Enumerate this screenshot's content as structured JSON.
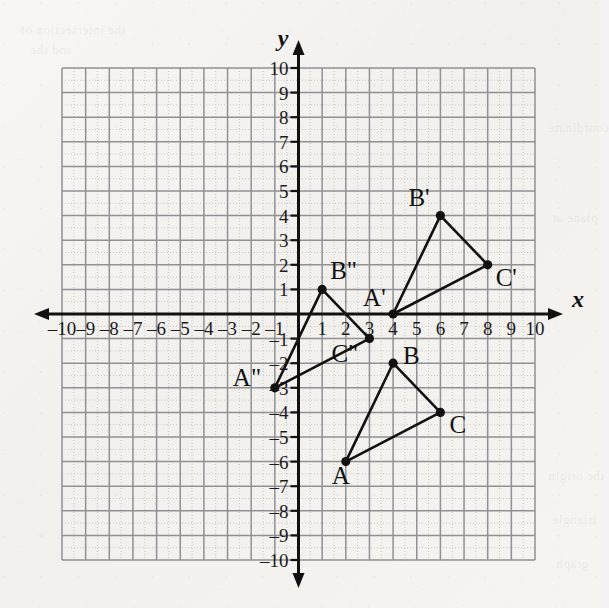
{
  "figure": {
    "axis_labels": {
      "x": "x",
      "y": "y"
    },
    "x_ticks": [
      "–10",
      "–9",
      "–8",
      "–7",
      "–6",
      "–5",
      "–4",
      "–3",
      "–2",
      "–1",
      "1",
      "2",
      "3",
      "4",
      "5",
      "6",
      "7",
      "8",
      "9",
      "10"
    ],
    "y_ticks": [
      "10",
      "9",
      "8",
      "7",
      "6",
      "5",
      "4",
      "3",
      "2",
      "1",
      "–1",
      "–2",
      "–3",
      "–4",
      "–5",
      "–6",
      "–7",
      "–8",
      "–9",
      "–10"
    ],
    "colors": {
      "ink": "#111111",
      "grid_major": "#8f9194",
      "grid_minor": "#c9cacc",
      "paper": "#f4f3f1"
    }
  },
  "chart_data": {
    "type": "scatter",
    "title": "",
    "xlabel": "x",
    "ylabel": "y",
    "xlim": [
      -10,
      10
    ],
    "ylim": [
      -10,
      10
    ],
    "grid": true,
    "legend": "none",
    "series": [
      {
        "name": "Triangle ABC",
        "closed": true,
        "points": [
          {
            "label": "A",
            "x": 2,
            "y": -6,
            "label_dx": -14,
            "label_dy": 22
          },
          {
            "label": "B",
            "x": 4,
            "y": -2,
            "label_dx": 10,
            "label_dy": 1
          },
          {
            "label": "C",
            "x": 6,
            "y": -4,
            "label_dx": 9,
            "label_dy": 21
          }
        ]
      },
      {
        "name": "Triangle A'B'C'",
        "closed": true,
        "points": [
          {
            "label": "A'",
            "x": 4,
            "y": 0,
            "label_dx": -30,
            "label_dy": -8
          },
          {
            "label": "B'",
            "x": 6,
            "y": 4,
            "label_dx": -32,
            "label_dy": -10
          },
          {
            "label": "C'",
            "x": 8,
            "y": 2,
            "label_dx": 8,
            "label_dy": 21
          }
        ]
      },
      {
        "name": "Triangle A\"B\"C\"",
        "closed": true,
        "points": [
          {
            "label": "A\"",
            "x": -1,
            "y": -3,
            "label_dx": -42,
            "label_dy": -2
          },
          {
            "label": "B\"",
            "x": 1,
            "y": 1,
            "label_dx": 8,
            "label_dy": -10
          },
          {
            "label": "C\"",
            "x": 3,
            "y": -1,
            "label_dx": -38,
            "label_dy": 23
          }
        ]
      }
    ]
  },
  "bleed_through": [
    {
      "text": "the intersection of",
      "x": 20,
      "y": 22
    },
    {
      "text": "and the",
      "x": 30,
      "y": 42
    },
    {
      "text": "coordinate",
      "x": 548,
      "y": 120
    },
    {
      "text": "plane at",
      "x": 552,
      "y": 210
    },
    {
      "text": "the origin",
      "x": 548,
      "y": 468
    },
    {
      "text": "triangle",
      "x": 552,
      "y": 512
    },
    {
      "text": "graph",
      "x": 556,
      "y": 556
    }
  ]
}
